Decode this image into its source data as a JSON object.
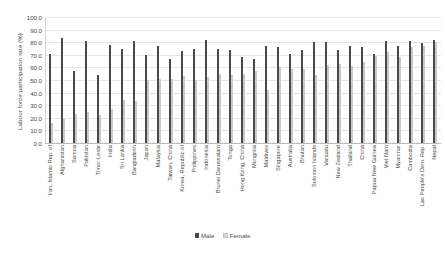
{
  "chart_data": {
    "type": "bar",
    "title": "",
    "xlabel": "",
    "ylabel": "Labour force participation rate (%)",
    "ylim": [
      0,
      100
    ],
    "ytick_labels": [
      "100.0",
      "90.0",
      "80.0",
      "70.0",
      "60.0",
      "50.0",
      "40.0",
      "30.0",
      "20.0",
      "10.0",
      "0.0"
    ],
    "ytick_values": [
      100,
      90,
      80,
      70,
      60,
      50,
      40,
      30,
      20,
      10,
      0
    ],
    "grid": true,
    "legend_position": "bottom",
    "categories": [
      "Iran, Islamic Rep. of",
      "Afghanistan",
      "Samoa",
      "Pakistan",
      "Timor-Leste",
      "India",
      "Sri Lanka",
      "Bangladesh",
      "Japan",
      "Malaysia",
      "Taiwan, China",
      "Korea, Republic of",
      "Philippines",
      "Indonesia",
      "Brunei Darussalam",
      "Tonga",
      "Hong Kong, China",
      "Mongolia",
      "Maldives",
      "Singapore",
      "Australia",
      "Bhutan",
      "Solomon Islands",
      "Vanuatu",
      "New Zealand",
      "Thailand",
      "China",
      "Papua New Guinea",
      "Viet Nam",
      "Myanmar",
      "Cambodia",
      "Lao People's Dem. Rep.",
      "Nepal"
    ],
    "series": [
      {
        "name": "Male",
        "color": "#4a4a4a",
        "values": [
          71,
          83,
          57,
          81,
          54,
          78,
          75,
          81,
          70,
          77,
          67,
          73,
          75,
          82,
          75,
          74,
          68,
          67,
          77,
          76,
          71,
          74,
          80,
          80,
          74,
          77,
          76,
          71,
          81,
          77,
          81,
          79,
          82
        ]
      },
      {
        "name": "Female",
        "color": "#c9c9c9",
        "values": [
          16,
          19,
          23,
          25,
          22,
          27,
          34,
          33,
          50,
          51,
          51,
          53,
          50,
          52,
          55,
          54,
          55,
          57,
          42,
          60,
          59,
          59,
          54,
          62,
          63,
          61,
          64,
          69,
          72,
          68,
          76,
          77,
          80
        ]
      }
    ]
  },
  "legend": {
    "items": [
      {
        "label": "Male"
      },
      {
        "label": "Female"
      }
    ]
  }
}
